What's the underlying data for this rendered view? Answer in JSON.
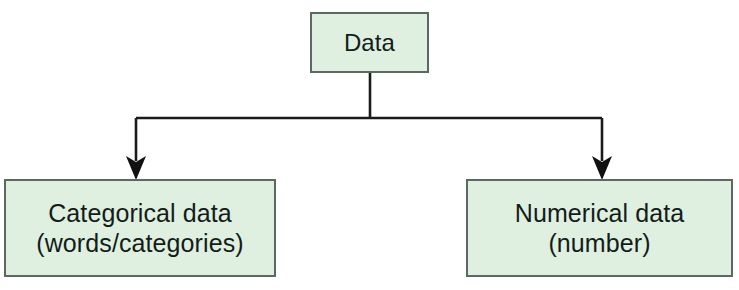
{
  "diagram": {
    "type": "flowchart",
    "orientation": "top-down",
    "colors": {
      "node_fill": "#dff0e1",
      "node_border": "#5a6a62",
      "edge": "#1b1b1b",
      "text": "#141c1a",
      "background": "#ffffff"
    },
    "nodes": [
      {
        "id": "root",
        "label": "Data",
        "lines": [
          "Data"
        ],
        "x": 310,
        "y": 12,
        "width": 119,
        "height": 61
      },
      {
        "id": "categorical",
        "label": "Categorical data\n(words/categories)",
        "lines": [
          "Categorical data",
          "(words/categories)"
        ],
        "x": 4,
        "y": 179,
        "width": 272,
        "height": 98
      },
      {
        "id": "numerical",
        "label": "Numerical data\n(number)",
        "lines": [
          "Numerical data",
          "(number)"
        ],
        "x": 466,
        "y": 179,
        "width": 267,
        "height": 98
      }
    ],
    "edges": [
      {
        "id": "root-to-categorical",
        "from": "root",
        "to": "categorical",
        "arrow": "down-arrowhead"
      },
      {
        "id": "root-to-numerical",
        "from": "root",
        "to": "numerical",
        "arrow": "down-arrowhead"
      }
    ]
  }
}
